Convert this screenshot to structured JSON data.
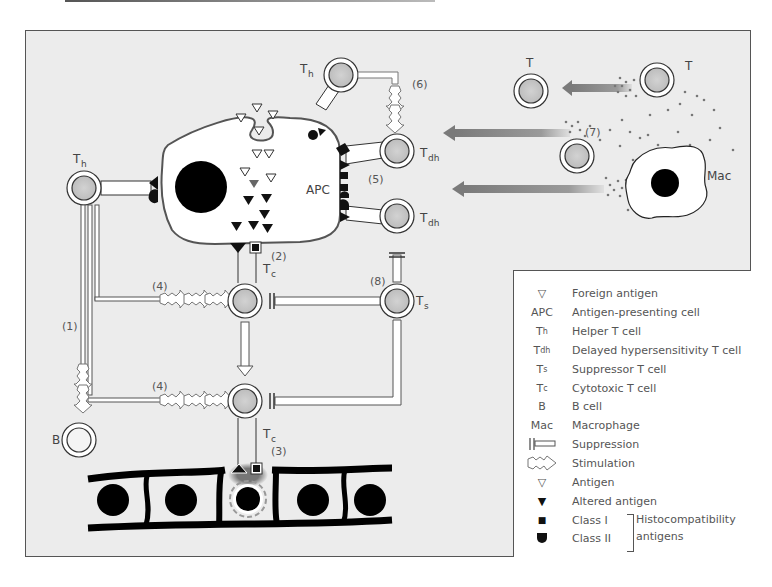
{
  "diagram": {
    "title": "",
    "cells": {
      "apc": {
        "label": "APC"
      },
      "th_left": {
        "main": "T",
        "sub": "h"
      },
      "th_top": {
        "main": "T",
        "sub": "h"
      },
      "tdh_upper": {
        "main": "T",
        "sub": "dh"
      },
      "tdh_lower": {
        "main": "T",
        "sub": "dh"
      },
      "tc_upper": {
        "main": "T",
        "sub": "c"
      },
      "tc_lower": {
        "main": "T",
        "sub": "c"
      },
      "ts": {
        "main": "T",
        "sub": "s"
      },
      "b": {
        "label": "B"
      },
      "t_right": {
        "label": "T"
      },
      "t_left": {
        "label": "T"
      },
      "mac": {
        "label": "Mac"
      }
    },
    "steps": {
      "s1": "(1)",
      "s2": "(2)",
      "s3": "(3)",
      "s4a": "(4)",
      "s4b": "(4)",
      "s5": "(5)",
      "s6": "(6)",
      "s7": "(7)",
      "s8": "(8)"
    },
    "colors": {
      "background": "#ececec",
      "cell_fill": "#c8c8c8",
      "dark": "#111111",
      "arrow_gray": "#8a8a8a",
      "outline": "#444444"
    }
  },
  "legend": {
    "items": [
      {
        "symbol": "▽",
        "symbol_name": "foreign-antigen-icon",
        "label": "Foreign antigen"
      },
      {
        "symbol": "APC",
        "symbol_name": "apc-abbrev",
        "label": "Antigen-presenting cell"
      },
      {
        "symbol": "T",
        "sub": "h",
        "symbol_name": "th-abbrev",
        "label": "Helper T cell"
      },
      {
        "symbol": "T",
        "sub": "dh",
        "symbol_name": "tdh-abbrev",
        "label": "Delayed hypersensitivity T cell"
      },
      {
        "symbol": "T",
        "sub": "s",
        "symbol_name": "ts-abbrev",
        "label": "Suppressor T cell"
      },
      {
        "symbol": "T",
        "sub": "c",
        "symbol_name": "tc-abbrev",
        "label": "Cytotoxic T cell"
      },
      {
        "symbol": "B",
        "symbol_name": "b-abbrev",
        "label": "B cell"
      },
      {
        "symbol": "Mac",
        "symbol_name": "mac-abbrev",
        "label": "Macrophage"
      },
      {
        "symbol": "suppression",
        "symbol_name": "suppression-icon",
        "label": "Suppression"
      },
      {
        "symbol": "stimulation",
        "symbol_name": "stimulation-icon",
        "label": "Stimulation"
      },
      {
        "symbol": "▽",
        "symbol_name": "antigen-icon",
        "label": "Antigen"
      },
      {
        "symbol": "▼",
        "symbol_name": "altered-antigen-icon",
        "label": "Altered antigen"
      },
      {
        "symbol": "■",
        "symbol_name": "class-i-icon",
        "label": "Class I"
      },
      {
        "symbol": "class2",
        "symbol_name": "class-ii-icon",
        "label": "Class II"
      }
    ],
    "group_label": "Histocompatibility antigens"
  }
}
